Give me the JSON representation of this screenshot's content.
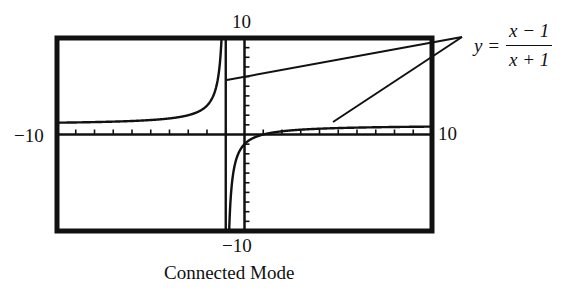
{
  "chart_data": {
    "type": "line",
    "title": "",
    "function": "y = (x - 1)/(x + 1)",
    "equation_label": {
      "lhs": "y =",
      "numerator": "x − 1",
      "denominator": "x + 1"
    },
    "caption": "Connected Mode",
    "xlim": [
      -10,
      10
    ],
    "ylim": [
      -10,
      10
    ],
    "tick_labels": {
      "x_min": "−10",
      "x_max": "10",
      "y_max": "10",
      "y_min": "−10"
    },
    "x_tick_spacing": 1,
    "y_tick_spacing": 1,
    "grid": false,
    "vertical_asymptote": -1,
    "horizontal_asymptote": 1,
    "connected_mode_artifact": "vertical line drawn at x = -1 joining the two branches",
    "series": [
      {
        "name": "left branch",
        "x": [
          -10,
          -8,
          -6,
          -4,
          -3,
          -2,
          -1.5,
          -1.2
        ],
        "y": [
          1.22,
          1.29,
          1.4,
          1.67,
          2,
          3,
          5,
          11
        ]
      },
      {
        "name": "right branch",
        "x": [
          -0.85,
          -0.7,
          -0.5,
          -0.3,
          0,
          1,
          2,
          4,
          6,
          8,
          10
        ],
        "y": [
          -12.3,
          -5.67,
          -3,
          -1.86,
          -1,
          0,
          0.33,
          0.6,
          0.71,
          0.78,
          0.82
        ]
      }
    ]
  },
  "labels": {
    "top_y": "10",
    "bottom_y": "−10",
    "left_x": "−10",
    "right_x": "10",
    "caption": "Connected Mode"
  }
}
